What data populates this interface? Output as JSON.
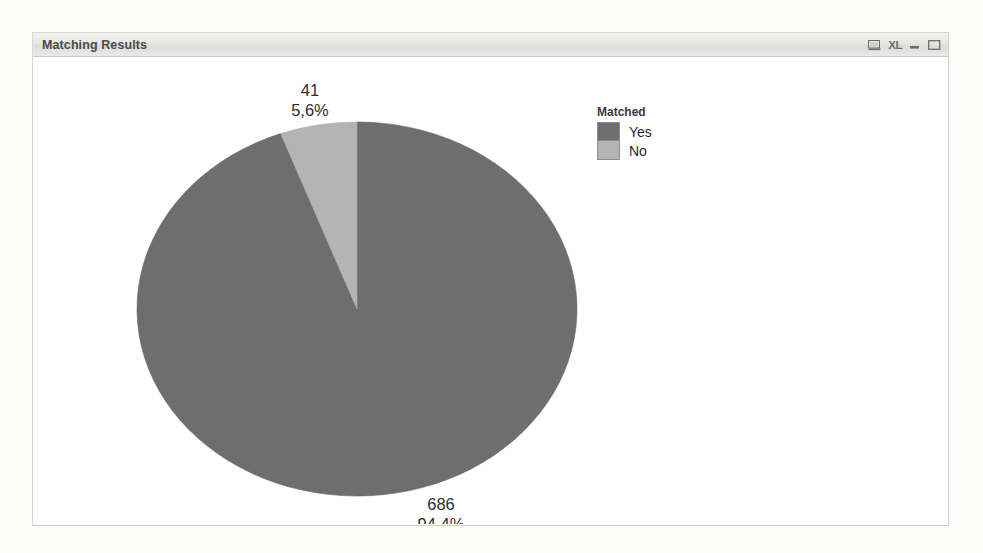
{
  "window": {
    "title": "Matching Results",
    "buttons": [
      {
        "name": "print-preview-icon",
        "label": ""
      },
      {
        "name": "excel-export-icon",
        "label": "XL"
      },
      {
        "name": "minimize-button",
        "label": ""
      },
      {
        "name": "maximize-button",
        "label": ""
      }
    ]
  },
  "legend": {
    "title": "Matched",
    "entries": [
      {
        "label": "Yes",
        "color": "#6e6e6e"
      },
      {
        "label": "No",
        "color": "#b4b4b4"
      }
    ]
  },
  "labels": {
    "no": {
      "value": "41",
      "percent": "5,6%"
    },
    "yes": {
      "value": "686",
      "percent": "94,4%"
    }
  },
  "colors": {
    "yes_slice": "#6e6e6e",
    "no_slice": "#b4b4b4",
    "slice_outline": "#5f5f5f",
    "title_text": "#4b4b4b",
    "label_text": "#2d2d2d"
  },
  "background_text": {
    "right_column": [
      "and the ... ... ....... Please the event appointment",
      "of we ... .... a .. 11 ............... example, and ....",
      "was to ...... .... .... ...... ... ..... ...... ...... some of",
      "form ... ..... ..... ...... ... ... .. ...... ... M.M.",
      "..... ...... .... ... ... ...... ..... .... ..... ...... the",
      "..... ... ... ...... .... ........ ..... ..... ...... and ...",
      ".. ... ... .. .... ....... ......... ...... ...... ..... ...",
      "..... ... .. ...... ... ...... .... .... ..... ... .... ...",
      ".... ..... .. .... ..... .... ...... ...... ..... ... .. ..."
    ]
  },
  "chart_data": {
    "type": "pie",
    "title": "Matching Results",
    "legend_title": "Matched",
    "legend_position": "right",
    "categories": [
      "Yes",
      "No"
    ],
    "values": [
      686,
      41
    ],
    "percents": [
      94.4,
      5.6
    ],
    "display_values": [
      "686",
      "41"
    ],
    "display_percents": [
      "94,4%",
      "5,6%"
    ],
    "colors": [
      "#6e6e6e",
      "#b4b4b4"
    ],
    "total": 727,
    "decimal_separator": ",",
    "start_angle_deg": 0,
    "direction": "clockwise",
    "shape": "ellipse",
    "xlabel": "",
    "ylabel": "",
    "grid": false
  }
}
